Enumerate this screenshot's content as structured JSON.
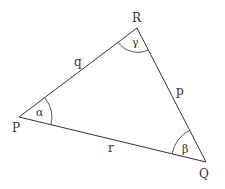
{
  "diagram": {
    "vertices": {
      "P": {
        "label": "P",
        "x": 19,
        "y": 117
      },
      "R": {
        "label": "R",
        "x": 137,
        "y": 28
      },
      "Q": {
        "label": "Q",
        "x": 206,
        "y": 162
      }
    },
    "sides": {
      "q": {
        "label": "q",
        "between": [
          "P",
          "R"
        ]
      },
      "p": {
        "label": "p",
        "between": [
          "R",
          "Q"
        ]
      },
      "r": {
        "label": "r",
        "between": [
          "P",
          "Q"
        ]
      }
    },
    "angles": {
      "alpha": {
        "label": "α",
        "at": "P"
      },
      "beta": {
        "label": "β",
        "at": "Q"
      },
      "gamma": {
        "label": "γ",
        "at": "R"
      }
    }
  }
}
